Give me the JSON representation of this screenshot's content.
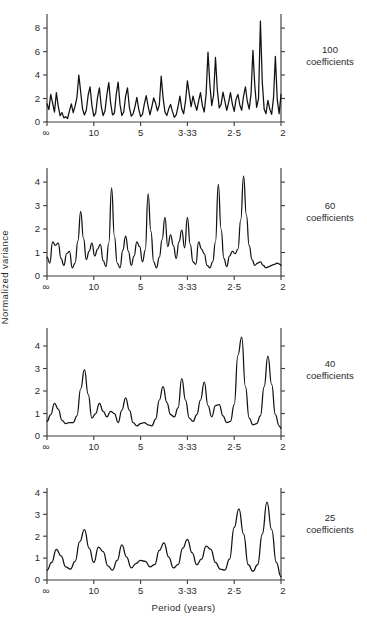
{
  "figure": {
    "ylabel": "Normalized   variance",
    "xtitle": "Period (years)"
  },
  "chart_data": [
    {
      "type": "line",
      "title": "100 coefficients",
      "panel_label_n": "100",
      "panel_label_word": "coefficients",
      "xlabel": "",
      "ylabel": "Normalized variance",
      "x_is_frequency": true,
      "xtick_positions": [
        0,
        0.1,
        0.2,
        0.3,
        0.4,
        0.5
      ],
      "xtick_labels": [
        "∞",
        "10",
        "5",
        "3·33",
        "2·5",
        "2"
      ],
      "ylim": [
        0,
        9.2
      ],
      "ytick_values": [
        0,
        2,
        4,
        6,
        8
      ],
      "ytick_labels": [
        "0",
        "2",
        "4",
        "6",
        "8"
      ],
      "grid": false,
      "x": [
        0.0,
        0.004,
        0.008,
        0.012,
        0.016,
        0.02,
        0.024,
        0.028,
        0.032,
        0.036,
        0.04,
        0.044,
        0.048,
        0.052,
        0.056,
        0.06,
        0.064,
        0.068,
        0.072,
        0.076,
        0.08,
        0.084,
        0.088,
        0.092,
        0.096,
        0.1,
        0.104,
        0.108,
        0.112,
        0.116,
        0.12,
        0.124,
        0.128,
        0.132,
        0.136,
        0.14,
        0.144,
        0.148,
        0.152,
        0.156,
        0.16,
        0.164,
        0.168,
        0.172,
        0.176,
        0.18,
        0.184,
        0.188,
        0.192,
        0.196,
        0.2,
        0.204,
        0.208,
        0.212,
        0.216,
        0.22,
        0.224,
        0.228,
        0.232,
        0.236,
        0.24,
        0.244,
        0.248,
        0.252,
        0.256,
        0.26,
        0.264,
        0.268,
        0.272,
        0.276,
        0.28,
        0.284,
        0.288,
        0.292,
        0.296,
        0.3,
        0.304,
        0.308,
        0.312,
        0.316,
        0.32,
        0.324,
        0.328,
        0.332,
        0.336,
        0.34,
        0.344,
        0.348,
        0.352,
        0.356,
        0.36,
        0.364,
        0.368,
        0.372,
        0.376,
        0.38,
        0.384,
        0.388,
        0.392,
        0.396,
        0.4,
        0.404,
        0.408,
        0.412,
        0.416,
        0.42,
        0.424,
        0.428,
        0.432,
        0.436,
        0.44,
        0.444,
        0.448,
        0.452,
        0.456,
        0.46,
        0.464,
        0.468,
        0.472,
        0.476,
        0.48,
        0.484,
        0.488,
        0.492,
        0.496,
        0.5
      ],
      "y": [
        1.55,
        1.05,
        2.35,
        1.6,
        0.85,
        2.5,
        1.35,
        0.55,
        0.8,
        0.35,
        0.45,
        0.3,
        0.95,
        1.55,
        0.8,
        1.35,
        2.1,
        4.0,
        2.55,
        1.1,
        0.6,
        1.0,
        2.3,
        3.0,
        1.4,
        0.5,
        0.75,
        2.1,
        2.9,
        1.3,
        0.55,
        0.95,
        2.35,
        3.35,
        1.6,
        0.6,
        0.75,
        2.35,
        3.4,
        1.5,
        0.55,
        0.85,
        2.2,
        2.9,
        1.25,
        0.5,
        0.7,
        1.3,
        2.1,
        1.1,
        0.45,
        0.65,
        1.55,
        2.25,
        1.35,
        0.6,
        1.3,
        2.05,
        1.6,
        0.95,
        1.45,
        3.9,
        2.1,
        0.85,
        0.55,
        1.1,
        1.5,
        0.9,
        0.4,
        0.6,
        1.3,
        2.2,
        1.1,
        0.7,
        1.8,
        3.5,
        2.4,
        1.3,
        2.2,
        1.55,
        1.0,
        1.8,
        2.5,
        1.4,
        0.85,
        2.4,
        5.95,
        3.2,
        1.4,
        2.3,
        5.5,
        2.7,
        1.2,
        1.5,
        2.55,
        1.8,
        1.0,
        1.65,
        2.5,
        1.55,
        0.9,
        1.95,
        2.35,
        1.45,
        1.0,
        2.2,
        3.0,
        1.75,
        1.1,
        2.4,
        6.1,
        3.1,
        1.25,
        2.0,
        8.6,
        3.4,
        1.1,
        0.7,
        1.85,
        1.1,
        0.65,
        2.05,
        5.6,
        1.9,
        0.7,
        2.35,
        2.3,
        1.05,
        0.7
      ]
    },
    {
      "type": "line",
      "title": "60 coefficients",
      "panel_label_n": "60",
      "panel_label_word": "coefficients",
      "xlabel": "",
      "ylabel": "Normalized variance",
      "x_is_frequency": true,
      "xtick_positions": [
        0,
        0.1,
        0.2,
        0.3,
        0.4,
        0.5
      ],
      "xtick_labels": [
        "∞",
        "10",
        "5",
        "3·33",
        "2·5",
        "2"
      ],
      "ylim": [
        0,
        4.6
      ],
      "ytick_values": [
        0,
        1,
        2,
        3,
        4
      ],
      "ytick_labels": [
        "0",
        "1",
        "2",
        "3",
        "4"
      ],
      "grid": false,
      "x": [
        0.0,
        0.006,
        0.012,
        0.018,
        0.024,
        0.03,
        0.036,
        0.042,
        0.048,
        0.054,
        0.06,
        0.066,
        0.072,
        0.078,
        0.084,
        0.09,
        0.096,
        0.102,
        0.108,
        0.114,
        0.12,
        0.126,
        0.132,
        0.138,
        0.144,
        0.15,
        0.156,
        0.162,
        0.168,
        0.174,
        0.18,
        0.186,
        0.192,
        0.198,
        0.204,
        0.21,
        0.216,
        0.222,
        0.228,
        0.234,
        0.24,
        0.246,
        0.252,
        0.258,
        0.264,
        0.27,
        0.276,
        0.282,
        0.288,
        0.294,
        0.3,
        0.306,
        0.312,
        0.318,
        0.324,
        0.33,
        0.336,
        0.342,
        0.348,
        0.354,
        0.36,
        0.366,
        0.372,
        0.378,
        0.384,
        0.39,
        0.396,
        0.402,
        0.408,
        0.414,
        0.42,
        0.426,
        0.432,
        0.438,
        0.444,
        0.45,
        0.456,
        0.462,
        0.468,
        0.474,
        0.48,
        0.486,
        0.492,
        0.498,
        0.5
      ],
      "y": [
        0.8,
        0.55,
        1.45,
        1.3,
        1.4,
        0.75,
        0.45,
        0.95,
        1.05,
        0.35,
        0.55,
        1.5,
        2.75,
        1.6,
        0.7,
        1.05,
        1.4,
        0.85,
        1.15,
        1.35,
        0.65,
        0.4,
        1.4,
        3.75,
        1.7,
        0.55,
        0.35,
        1.1,
        1.7,
        1.05,
        0.45,
        0.85,
        1.45,
        1.25,
        0.6,
        1.1,
        3.5,
        1.9,
        0.6,
        0.35,
        0.8,
        1.55,
        2.5,
        1.25,
        1.75,
        1.3,
        0.75,
        1.45,
        1.95,
        1.2,
        2.5,
        1.35,
        0.6,
        0.5,
        1.45,
        1.15,
        0.95,
        0.45,
        0.35,
        0.6,
        1.45,
        3.9,
        2.0,
        0.75,
        0.4,
        0.85,
        1.05,
        0.95,
        1.15,
        2.4,
        4.25,
        2.6,
        1.3,
        0.7,
        0.45,
        0.55,
        0.6,
        0.45,
        0.35,
        0.4,
        0.45,
        0.5,
        0.55,
        0.5,
        0.45
      ]
    },
    {
      "type": "line",
      "title": "40 coefficients",
      "panel_label_n": "40",
      "panel_label_word": "coefficients",
      "xlabel": "",
      "ylabel": "Normalized variance",
      "x_is_frequency": true,
      "xtick_positions": [
        0,
        0.1,
        0.2,
        0.3,
        0.4,
        0.5
      ],
      "xtick_labels": [
        "∞",
        "10",
        "5",
        "3·33",
        "2·5",
        "2"
      ],
      "ylim": [
        0,
        4.8
      ],
      "ytick_values": [
        0,
        1,
        2,
        3,
        4
      ],
      "ytick_labels": [
        "0",
        "1",
        "2",
        "3",
        "4"
      ],
      "grid": false,
      "x": [
        0.0,
        0.008,
        0.016,
        0.024,
        0.032,
        0.04,
        0.048,
        0.056,
        0.064,
        0.072,
        0.08,
        0.088,
        0.096,
        0.104,
        0.112,
        0.12,
        0.128,
        0.136,
        0.144,
        0.152,
        0.16,
        0.168,
        0.176,
        0.184,
        0.192,
        0.2,
        0.208,
        0.216,
        0.224,
        0.232,
        0.24,
        0.248,
        0.256,
        0.264,
        0.272,
        0.28,
        0.288,
        0.296,
        0.304,
        0.312,
        0.32,
        0.328,
        0.336,
        0.344,
        0.352,
        0.36,
        0.368,
        0.376,
        0.384,
        0.392,
        0.4,
        0.408,
        0.416,
        0.424,
        0.432,
        0.44,
        0.448,
        0.456,
        0.464,
        0.472,
        0.48,
        0.488,
        0.496,
        0.5
      ],
      "y": [
        0.65,
        0.95,
        1.45,
        1.2,
        0.7,
        0.55,
        0.6,
        0.6,
        0.9,
        2.1,
        2.95,
        1.85,
        0.8,
        1.0,
        1.45,
        1.1,
        0.85,
        1.1,
        1.0,
        0.6,
        1.15,
        1.7,
        1.15,
        0.6,
        0.45,
        0.55,
        0.6,
        0.5,
        0.45,
        0.75,
        1.6,
        2.2,
        1.5,
        0.95,
        0.85,
        1.25,
        2.55,
        1.6,
        0.8,
        0.65,
        0.95,
        1.6,
        2.4,
        1.35,
        0.85,
        1.35,
        1.4,
        0.9,
        0.6,
        0.65,
        1.4,
        3.6,
        4.4,
        2.2,
        0.8,
        0.5,
        0.55,
        0.9,
        2.2,
        3.55,
        2.3,
        0.95,
        0.45,
        0.35
      ]
    },
    {
      "type": "line",
      "title": "25 coefficients",
      "panel_label_n": "25",
      "panel_label_word": "coefficients",
      "xlabel": "Period (years)",
      "ylabel": "Normalized variance",
      "x_is_frequency": true,
      "xtick_positions": [
        0,
        0.1,
        0.2,
        0.3,
        0.4,
        0.5
      ],
      "xtick_labels": [
        "∞",
        "10",
        "5",
        "3·33",
        "2·5",
        "2"
      ],
      "ylim": [
        0,
        4.2
      ],
      "ytick_values": [
        0,
        1,
        2,
        3,
        4
      ],
      "ytick_labels": [
        "0",
        "1",
        "2",
        "3",
        "4"
      ],
      "grid": false,
      "x": [
        0.0,
        0.01,
        0.02,
        0.03,
        0.04,
        0.05,
        0.06,
        0.07,
        0.08,
        0.09,
        0.1,
        0.11,
        0.12,
        0.13,
        0.14,
        0.15,
        0.16,
        0.17,
        0.18,
        0.19,
        0.2,
        0.21,
        0.22,
        0.23,
        0.24,
        0.25,
        0.26,
        0.27,
        0.28,
        0.29,
        0.3,
        0.31,
        0.32,
        0.33,
        0.34,
        0.35,
        0.36,
        0.37,
        0.38,
        0.39,
        0.4,
        0.41,
        0.42,
        0.43,
        0.44,
        0.45,
        0.46,
        0.47,
        0.48,
        0.49,
        0.5
      ],
      "y": [
        0.45,
        0.8,
        1.4,
        1.1,
        0.6,
        0.5,
        0.85,
        1.75,
        2.3,
        1.45,
        0.8,
        1.5,
        1.3,
        0.65,
        0.45,
        0.9,
        1.6,
        1.05,
        0.55,
        0.75,
        0.9,
        0.85,
        0.6,
        0.7,
        1.35,
        1.7,
        1.05,
        0.55,
        0.7,
        1.45,
        1.85,
        1.25,
        0.7,
        0.95,
        1.55,
        1.4,
        0.8,
        0.5,
        0.45,
        0.95,
        2.4,
        3.25,
        2.1,
        0.7,
        0.4,
        0.7,
        2.1,
        3.55,
        2.3,
        0.8,
        0.15
      ]
    }
  ]
}
